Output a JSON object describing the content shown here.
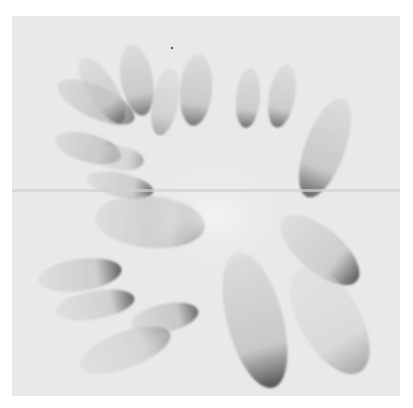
{
  "image": {
    "description": "Grayscale watercolor-style abstract painting of translucent petal shapes radiating from a pale central area, on textured paper with a faint horizontal fold line",
    "colors": {
      "page_background": "#ffffff",
      "paper": "#e9e9e9",
      "center_highlight": "#f2f2f2",
      "petal_light": "#c8c8c8",
      "petal_mid": "#a8a8a8",
      "petal_dark": "#5a5a5a",
      "fold_line": "#d2d2d2"
    },
    "petals": [
      {
        "cx": 96,
        "cy": 102,
        "rx": 42,
        "ry": 16,
        "rot": 25,
        "shade": "#b9b9b9",
        "edge": "#6e6e6e"
      },
      {
        "cx": 88,
        "cy": 148,
        "rx": 34,
        "ry": 14,
        "rot": 15,
        "shade": "#bcbcbc",
        "edge": "#6a6a6a"
      },
      {
        "cx": 118,
        "cy": 158,
        "rx": 26,
        "ry": 12,
        "rot": 8,
        "shade": "#cfcfcf",
        "edge": "#9a9a9a"
      },
      {
        "cx": 120,
        "cy": 185,
        "rx": 34,
        "ry": 12,
        "rot": 12,
        "shade": "#c2c2c2",
        "edge": "#4e4e4e"
      },
      {
        "cx": 102,
        "cy": 90,
        "rx": 38,
        "ry": 14,
        "rot": 58,
        "shade": "#c5c5c5",
        "edge": "#5e5e5e"
      },
      {
        "cx": 137,
        "cy": 80,
        "rx": 36,
        "ry": 16,
        "rot": 80,
        "shade": "#bebebe",
        "edge": "#5c5c5c"
      },
      {
        "cx": 165,
        "cy": 102,
        "rx": 34,
        "ry": 13,
        "rot": 100,
        "shade": "#cacaca",
        "edge": "#9a9a9a"
      },
      {
        "cx": 196,
        "cy": 90,
        "rx": 36,
        "ry": 16,
        "rot": 95,
        "shade": "#bdbdbd",
        "edge": "#5a5a5a"
      },
      {
        "cx": 248,
        "cy": 98,
        "rx": 30,
        "ry": 12,
        "rot": 95,
        "shade": "#c0c0c0",
        "edge": "#4f4f4f"
      },
      {
        "cx": 282,
        "cy": 96,
        "rx": 32,
        "ry": 13,
        "rot": 100,
        "shade": "#c2c2c2",
        "edge": "#505050"
      },
      {
        "cx": 325,
        "cy": 148,
        "rx": 52,
        "ry": 20,
        "rot": 110,
        "shade": "#bdbdbd",
        "edge": "#444444"
      },
      {
        "cx": 150,
        "cy": 222,
        "rx": 55,
        "ry": 26,
        "rot": 5,
        "shade": "#c1c1c1",
        "edge": "#4a4a4a"
      },
      {
        "cx": 80,
        "cy": 275,
        "rx": 42,
        "ry": 16,
        "rot": -8,
        "shade": "#c4c4c4",
        "edge": "#3e3e3e"
      },
      {
        "cx": 95,
        "cy": 305,
        "rx": 40,
        "ry": 14,
        "rot": -10,
        "shade": "#c8c8c8",
        "edge": "#444444"
      },
      {
        "cx": 165,
        "cy": 318,
        "rx": 34,
        "ry": 14,
        "rot": -12,
        "shade": "#bababa",
        "edge": "#4a4a4a"
      },
      {
        "cx": 125,
        "cy": 350,
        "rx": 48,
        "ry": 18,
        "rot": -20,
        "shade": "#cdcdcd",
        "edge": "#9a9a9a"
      },
      {
        "cx": 255,
        "cy": 320,
        "rx": 70,
        "ry": 28,
        "rot": 75,
        "shade": "#bcbcbc",
        "edge": "#2e2e2e"
      },
      {
        "cx": 320,
        "cy": 250,
        "rx": 48,
        "ry": 22,
        "rot": 40,
        "shade": "#c3c3c3",
        "edge": "#3a3a3a"
      },
      {
        "cx": 330,
        "cy": 320,
        "rx": 60,
        "ry": 30,
        "rot": 60,
        "shade": "#d4d4d4",
        "edge": "#9a9a9a"
      }
    ]
  }
}
